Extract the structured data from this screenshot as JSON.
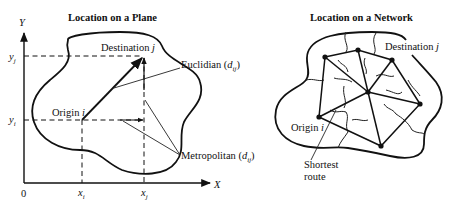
{
  "plane": {
    "title": "Location on a Plane",
    "axis_y": "Y",
    "axis_x": "X",
    "origin_zero": "0",
    "tick_yj": "y",
    "tick_yj_sub": "j",
    "tick_yi": "y",
    "tick_yi_sub": "i",
    "tick_xi": "x",
    "tick_xi_sub": "i",
    "tick_xj": "x",
    "tick_xj_sub": "j",
    "destination_label": "Destination ",
    "destination_var": "j",
    "origin_label": "Origin ",
    "origin_var": "i",
    "euclidian_label": "Euclidian (",
    "euclidian_var": "d",
    "euclidian_sub": "ij",
    "euclidian_close": ")",
    "metropolitan_label": "Metropolitan (",
    "metropolitan_var": "d",
    "metropolitan_sub": "ij",
    "metropolitan_close": ")"
  },
  "network": {
    "title": "Location on a Network",
    "destination_label": "Destination ",
    "destination_var": "j",
    "origin_label": "Origin ",
    "origin_var": "i",
    "shortest_route_line1": "Shortest",
    "shortest_route_line2": "route",
    "nodes": [
      {
        "id": "n1",
        "x": 325,
        "y": 57
      },
      {
        "id": "n2",
        "x": 358,
        "y": 50
      },
      {
        "id": "n3",
        "x": 392,
        "y": 60
      },
      {
        "id": "n4",
        "x": 420,
        "y": 104
      },
      {
        "id": "center",
        "x": 368,
        "y": 92
      },
      {
        "id": "origin",
        "x": 319,
        "y": 117
      },
      {
        "id": "n5",
        "x": 381,
        "y": 146
      }
    ]
  }
}
